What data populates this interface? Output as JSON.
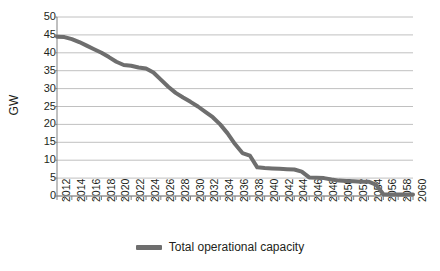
{
  "chart_data": {
    "type": "line",
    "title": "",
    "subtitle": "",
    "xlabel": "",
    "ylabel": "GW",
    "ylim": [
      0,
      50
    ],
    "ytick_values": [
      0,
      5,
      10,
      15,
      20,
      25,
      30,
      35,
      40,
      45,
      50
    ],
    "ytick_labels": [
      "0",
      "5",
      "10",
      "15",
      "20",
      "25",
      "30",
      "35",
      "40",
      "45",
      "50"
    ],
    "xlim": [
      2012,
      2060
    ],
    "xtick_labels": [
      "2012",
      "2014",
      "2016",
      "2018",
      "2020",
      "2022",
      "2024",
      "2026",
      "2028",
      "2030",
      "2032",
      "2034",
      "2036",
      "2038",
      "2040",
      "2042",
      "2044",
      "2046",
      "2048",
      "2050",
      "2052",
      "2054",
      "2056",
      "2058",
      "2060"
    ],
    "xtick_label_interval_years": 2,
    "minor_tick_interval_years": 1,
    "grid": "horizontal",
    "legend_position": "bottom-center",
    "series": [
      {
        "name": "Total operational capacity",
        "color": "#6e6e6e",
        "line_width": 4,
        "x": [
          2012,
          2013,
          2014,
          2015,
          2016,
          2017,
          2018,
          2019,
          2020,
          2021,
          2022,
          2023,
          2024,
          2025,
          2026,
          2027,
          2028,
          2029,
          2030,
          2031,
          2032,
          2033,
          2034,
          2035,
          2036,
          2037,
          2038,
          2039,
          2040,
          2041,
          2042,
          2043,
          2044,
          2045,
          2046,
          2047,
          2048,
          2049,
          2050,
          2051,
          2052,
          2053,
          2054,
          2055,
          2056,
          2057,
          2058,
          2059,
          2060
        ],
        "values": [
          44.5,
          44.4,
          43.8,
          43.0,
          42.0,
          41.0,
          40.0,
          38.8,
          37.5,
          36.6,
          36.4,
          35.9,
          35.6,
          34.5,
          32.5,
          30.5,
          28.8,
          27.5,
          26.3,
          25.0,
          23.5,
          22.0,
          20.0,
          17.5,
          14.5,
          12.0,
          11.3,
          8.0,
          7.8,
          7.7,
          7.6,
          7.5,
          7.4,
          6.8,
          5.2,
          5.1,
          5.0,
          4.6,
          4.3,
          4.2,
          4.1,
          4.0,
          4.0,
          3.2,
          0.5,
          0.4,
          0.4,
          0.4,
          0.4
        ]
      }
    ]
  },
  "legend": {
    "entries": [
      {
        "label": "Total operational capacity",
        "color": "#6e6e6e"
      }
    ]
  },
  "axes": {
    "y_title": "GW",
    "grid_color": "#b0b0b0",
    "axis_color": "#808080"
  }
}
